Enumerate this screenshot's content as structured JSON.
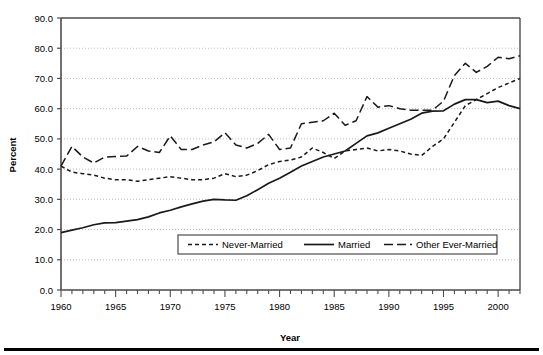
{
  "chart_data": {
    "type": "line",
    "title": "",
    "xlabel": "Year",
    "ylabel": "Percent",
    "xlim": [
      1960,
      2002
    ],
    "ylim": [
      0.0,
      90.0
    ],
    "ytick_step": 10.0,
    "grid": "horizontal-dotted",
    "legend_position": "inside-bottom-center",
    "x": [
      1960,
      1961,
      1962,
      1963,
      1964,
      1965,
      1966,
      1967,
      1968,
      1969,
      1970,
      1971,
      1972,
      1973,
      1974,
      1975,
      1976,
      1977,
      1978,
      1979,
      1980,
      1981,
      1982,
      1983,
      1984,
      1985,
      1986,
      1987,
      1988,
      1989,
      1990,
      1991,
      1992,
      1993,
      1994,
      1995,
      1996,
      1997,
      1998,
      1999,
      2000,
      2001,
      2002
    ],
    "xtick_labels": [
      "1960",
      "1965",
      "1970",
      "1975",
      "1980",
      "1985",
      "1990",
      "1995",
      "2000"
    ],
    "xtick_values": [
      1960,
      1965,
      1970,
      1975,
      1980,
      1985,
      1990,
      1995,
      2000
    ],
    "ytick_labels": [
      "0.0",
      "10.0",
      "20.0",
      "30.0",
      "40.0",
      "50.0",
      "60.0",
      "70.0",
      "80.0",
      "90.0"
    ],
    "ytick_values": [
      0.0,
      10.0,
      20.0,
      30.0,
      40.0,
      50.0,
      60.0,
      70.0,
      80.0,
      90.0
    ],
    "series": [
      {
        "name": "Never-Married",
        "style": "short-dash",
        "color": "#1a1a1a",
        "values": [
          41.0,
          39.0,
          38.5,
          38.0,
          37.0,
          36.5,
          36.5,
          36.0,
          36.5,
          37.0,
          37.5,
          37.0,
          36.5,
          36.5,
          37.0,
          38.5,
          37.5,
          38.0,
          39.5,
          41.5,
          42.5,
          43.0,
          44.0,
          47.0,
          45.5,
          43.5,
          46.0,
          46.5,
          47.0,
          46.0,
          46.5,
          46.0,
          45.0,
          44.5,
          47.5,
          50.0,
          55.5,
          61.0,
          63.0,
          65.0,
          67.0,
          68.5,
          70.0
        ]
      },
      {
        "name": "Married",
        "style": "solid",
        "color": "#1a1a1a",
        "values": [
          19.0,
          19.8,
          20.6,
          21.6,
          22.2,
          22.3,
          22.8,
          23.3,
          24.2,
          25.5,
          26.4,
          27.5,
          28.5,
          29.4,
          30.0,
          29.8,
          29.7,
          31.2,
          33.2,
          35.3,
          37.0,
          39.0,
          41.0,
          42.5,
          44.0,
          45.0,
          46.0,
          48.5,
          51.0,
          52.0,
          53.5,
          55.0,
          56.5,
          58.5,
          59.2,
          59.3,
          61.5,
          63.0,
          63.0,
          62.0,
          62.5,
          61.0,
          60.0
        ]
      },
      {
        "name": "Other Ever-Married",
        "style": "long-dash",
        "color": "#1a1a1a",
        "values": [
          41.0,
          47.5,
          44.0,
          42.0,
          44.0,
          44.2,
          44.3,
          47.5,
          46.0,
          45.5,
          51.0,
          46.5,
          46.5,
          48.0,
          49.0,
          52.0,
          48.0,
          47.0,
          48.5,
          51.5,
          46.5,
          47.0,
          55.0,
          55.5,
          56.0,
          58.5,
          54.5,
          56.0,
          64.0,
          60.5,
          61.0,
          60.0,
          59.5,
          59.5,
          59.5,
          62.5,
          71.0,
          75.0,
          72.0,
          74.0,
          77.0,
          76.5,
          77.5
        ]
      }
    ],
    "legend": [
      {
        "label": "Never-Married",
        "style": "short-dash"
      },
      {
        "label": "Married",
        "style": "solid"
      },
      {
        "label": "Other Ever-Married",
        "style": "long-dash"
      }
    ]
  }
}
